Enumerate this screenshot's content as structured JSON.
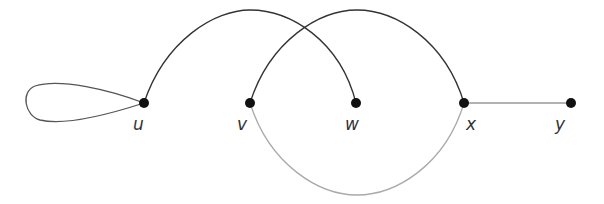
{
  "diagram": {
    "type": "graph",
    "nodes": [
      {
        "id": "u",
        "label": "u",
        "x": 144,
        "y": 103
      },
      {
        "id": "v",
        "label": "v",
        "x": 250,
        "y": 103
      },
      {
        "id": "w",
        "label": "w",
        "x": 356,
        "y": 103
      },
      {
        "id": "x",
        "label": "x",
        "x": 464,
        "y": 103
      },
      {
        "id": "y",
        "label": "y",
        "x": 571,
        "y": 103
      }
    ],
    "edges": [
      {
        "from": "u",
        "to": "u",
        "kind": "loop",
        "color": "#555555"
      },
      {
        "from": "u",
        "to": "w",
        "kind": "arc-over",
        "color": "#333333"
      },
      {
        "from": "v",
        "to": "x",
        "kind": "arc-over",
        "color": "#333333"
      },
      {
        "from": "v",
        "to": "x",
        "kind": "arc-under",
        "color": "#aaaaaa"
      },
      {
        "from": "x",
        "to": "y",
        "kind": "straight",
        "color": "#999999"
      }
    ],
    "colors": {
      "node": "#111111",
      "edge_dark": "#333333",
      "edge_light": "#aaaaaa"
    }
  }
}
